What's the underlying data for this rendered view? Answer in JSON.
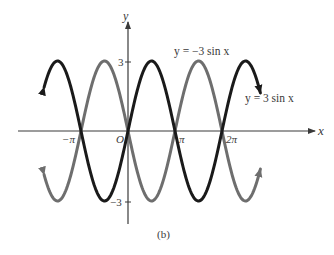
{
  "figure": {
    "caption": "(b)",
    "axes": {
      "x_label": "x",
      "y_label": "y",
      "x_ticks": [
        {
          "label": "−π",
          "value": -3.14159
        },
        {
          "label": "O",
          "value": 0
        },
        {
          "label": "π",
          "value": 3.14159
        },
        {
          "label": "2π",
          "value": 6.28319
        }
      ],
      "y_ticks": [
        {
          "label": "3",
          "value": 3
        },
        {
          "label": "−3",
          "value": -3
        }
      ]
    },
    "curves": [
      {
        "name": "y = 3 sin x",
        "label": "y = 3 sin x",
        "amplitude": 3,
        "color": "#1a1a1a"
      },
      {
        "name": "y = −3 sin x",
        "label": "y = −3 sin x",
        "amplitude": -3,
        "color": "#6e6e6e"
      }
    ],
    "labels": {
      "neg_curve": "y = −3 sin x",
      "pos_curve": "y = 3 sin x",
      "tick_3": "3",
      "tick_neg3": "−3",
      "tick_negpi": "−π",
      "tick_origin": "O",
      "tick_pi": "π",
      "tick_2pi": "2π"
    },
    "x_range": [
      -5.61,
      8.85
    ],
    "y_range": [
      -3,
      3
    ]
  }
}
